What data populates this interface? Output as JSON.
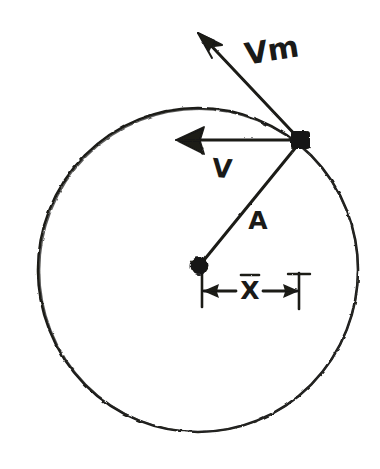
{
  "figure": {
    "style": "hand-drawn pencil sketch on white paper",
    "ink_color": "#1a1a18",
    "background_color": "#ffffff"
  },
  "labels": {
    "vm": "Vm",
    "v": "V",
    "a": "A",
    "x": "X"
  },
  "geometry": {
    "circle": {
      "name": "reference-circle",
      "center_x": 198,
      "center_y": 270,
      "radius": 160
    },
    "center_point": {
      "name": "circle-center-dot",
      "x": 199,
      "y": 266
    },
    "particle_point": {
      "name": "particle-dot",
      "x": 300,
      "y": 140
    },
    "diameter_line": {
      "name": "horizontal-diameter-dashed",
      "x1": 36,
      "y1": 269,
      "x2": 360,
      "y2": 269
    },
    "radius_vector": {
      "name": "radius-vector-A",
      "x1": 199,
      "y1": 266,
      "x2": 300,
      "y2": 141
    },
    "vm_vector": {
      "name": "vm-velocity-vector",
      "x1": 300,
      "y1": 140,
      "x2": 199,
      "y2": 33
    },
    "v_vector": {
      "name": "v-component-vector",
      "x1": 300,
      "y1": 140,
      "x2": 178,
      "y2": 140
    },
    "projection_line": {
      "name": "vertical-projection-dotted",
      "x1": 300,
      "y1": 150,
      "x2": 300,
      "y2": 262
    },
    "x_measure": {
      "name": "x-displacement-measure",
      "left_x": 203,
      "right_x": 299,
      "y": 291,
      "tick_top": 275,
      "tick_bottom": 306
    }
  },
  "label_positions": {
    "vm": {
      "x": 272,
      "y": 52,
      "size": 30,
      "rotate": -9
    },
    "v": {
      "x": 222,
      "y": 170,
      "size": 26,
      "rotate": 4
    },
    "a": {
      "x": 258,
      "y": 222,
      "size": 25,
      "rotate": 0
    },
    "x": {
      "x": 250,
      "y": 292,
      "size": 25,
      "rotate": 0
    }
  }
}
